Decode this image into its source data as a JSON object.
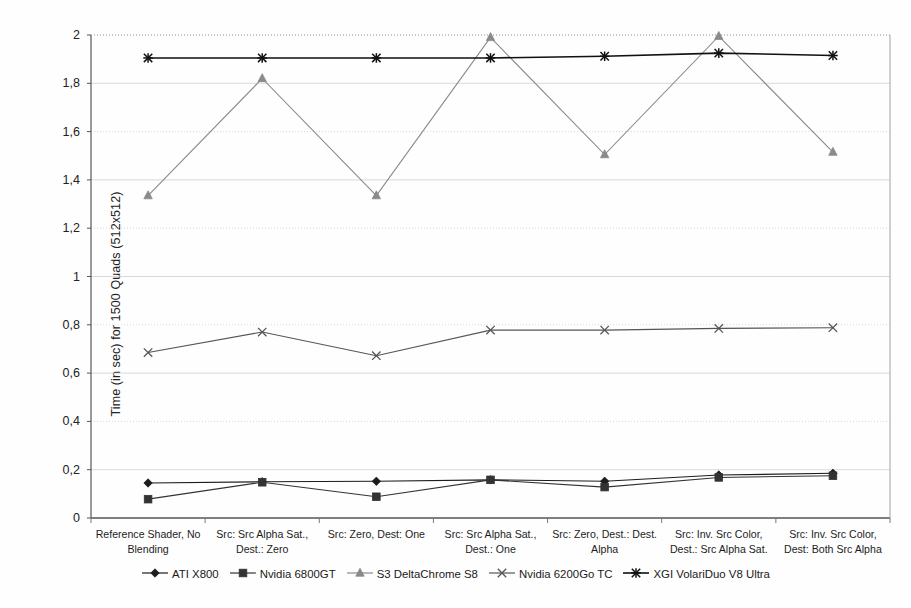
{
  "chart_data": {
    "type": "line",
    "title": "",
    "xlabel": "",
    "ylabel": "Time (in sec) for 1500 Quads (512x512)",
    "ylim": [
      0,
      2
    ],
    "ytick_labels": [
      "0",
      "0,2",
      "0,4",
      "0,6",
      "0,8",
      "1",
      "1,2",
      "1,4",
      "1,6",
      "1,8",
      "2"
    ],
    "ytick_values": [
      0,
      0.2,
      0.4,
      0.6,
      0.8,
      1.0,
      1.2,
      1.4,
      1.6,
      1.8,
      2.0
    ],
    "grid": true,
    "legend_position": "bottom",
    "categories": [
      "Reference Shader, No Blending",
      "Src: Src Alpha Sat., Dest.: Zero",
      "Src: Zero, Dest: One",
      "Src: Src Alpha Sat., Dest.: One",
      "Src: Zero, Dest.: Dest. Alpha",
      "Src: Inv. Src Color, Dest.: Src Alpha Sat.",
      "Src: Inv. Src Color, Dest: Both Src Alpha"
    ],
    "category_lines": [
      [
        "Reference Shader, No",
        "Blending"
      ],
      [
        "Src: Src Alpha Sat.,",
        "Dest.: Zero"
      ],
      [
        "Src: Zero, Dest: One",
        ""
      ],
      [
        "Src: Src Alpha Sat.,",
        "Dest.: One"
      ],
      [
        "Src: Zero, Dest.: Dest.",
        "Alpha"
      ],
      [
        "Src: Inv. Src Color,",
        "Dest.: Src Alpha Sat."
      ],
      [
        "Src: Inv. Src Color,",
        "Dest: Both Src Alpha"
      ]
    ],
    "series": [
      {
        "name": "ATI X800",
        "marker": "diamond",
        "color": "#1c1c1c",
        "values": [
          0.145,
          0.15,
          0.152,
          0.158,
          0.152,
          0.178,
          0.185
        ]
      },
      {
        "name": "Nvidia 6800GT",
        "marker": "square",
        "color": "#333333",
        "values": [
          0.078,
          0.148,
          0.088,
          0.158,
          0.128,
          0.168,
          0.175
        ]
      },
      {
        "name": "S3 DeltaChrome S8",
        "marker": "triangle",
        "color": "#8a8a8a",
        "values": [
          1.335,
          1.82,
          1.335,
          1.99,
          1.505,
          1.995,
          1.515
        ]
      },
      {
        "name": "Nvidia 6200Go TC",
        "marker": "x-star",
        "color": "#555555",
        "values": [
          0.685,
          0.77,
          0.672,
          0.778,
          0.778,
          0.785,
          0.788
        ]
      },
      {
        "name": "XGI VolariDuo V8 Ultra",
        "marker": "asterisk",
        "color": "#111111",
        "values": [
          1.905,
          1.905,
          1.905,
          1.905,
          1.912,
          1.925,
          1.915
        ]
      }
    ]
  }
}
